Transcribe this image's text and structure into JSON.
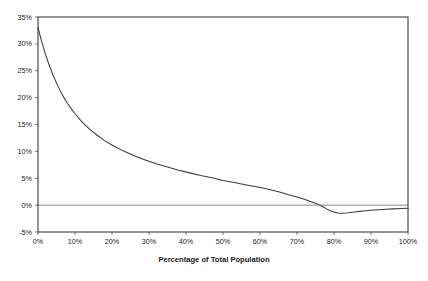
{
  "chart_data": {
    "type": "line",
    "title": "",
    "xlabel": "Percentage of Total Population",
    "ylabel": "",
    "xlim": [
      0,
      100
    ],
    "ylim": [
      -5,
      35
    ],
    "grid": false,
    "legend": false,
    "zero_line": 0,
    "xtick_labels": [
      "0%",
      "10%",
      "20%",
      "30%",
      "40%",
      "50%",
      "60%",
      "70%",
      "80%",
      "90%",
      "100%"
    ],
    "xtick_values": [
      0,
      10,
      20,
      30,
      40,
      50,
      60,
      70,
      80,
      90,
      100
    ],
    "ytick_labels": [
      "-5%",
      "0%",
      "5%",
      "10%",
      "15%",
      "20%",
      "25%",
      "30%",
      "35%"
    ],
    "ytick_values": [
      -5,
      0,
      5,
      10,
      15,
      20,
      25,
      30,
      35
    ],
    "series": [
      {
        "name": "share",
        "color": "#3a3a3a",
        "x": [
          0,
          1,
          2,
          3,
          4,
          5,
          6,
          7,
          8,
          9,
          10,
          12,
          14,
          16,
          18,
          20,
          23,
          26,
          29,
          32,
          35,
          38,
          41,
          44,
          47,
          50,
          53,
          56,
          59,
          62,
          65,
          68,
          70,
          72,
          74,
          75,
          76,
          77,
          78,
          79,
          80,
          81,
          82,
          83,
          84,
          85,
          86,
          87,
          88,
          90,
          92,
          94,
          96,
          98,
          100
        ],
        "values": [
          33.0,
          30.4,
          28.1,
          26.1,
          24.3,
          22.7,
          21.3,
          20.0,
          18.9,
          17.9,
          17.0,
          15.4,
          14.1,
          13.0,
          12.0,
          11.2,
          10.1,
          9.2,
          8.4,
          7.7,
          7.1,
          6.5,
          6.0,
          5.5,
          5.1,
          4.6,
          4.2,
          3.8,
          3.4,
          3.0,
          2.5,
          1.9,
          1.5,
          1.1,
          0.6,
          0.35,
          0.05,
          -0.3,
          -0.7,
          -1.05,
          -1.3,
          -1.45,
          -1.5,
          -1.48,
          -1.42,
          -1.34,
          -1.25,
          -1.16,
          -1.08,
          -0.95,
          -0.85,
          -0.77,
          -0.7,
          -0.64,
          -0.6
        ]
      }
    ]
  }
}
